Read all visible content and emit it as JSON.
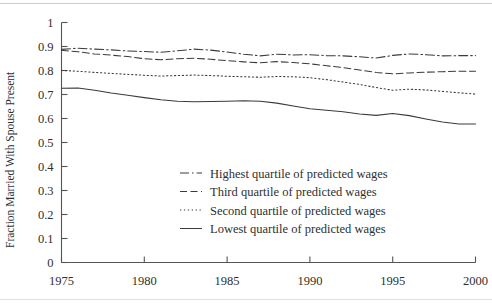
{
  "chart_data": {
    "type": "line",
    "title": "",
    "xlabel": "",
    "ylabel": "Fraction Married With Spouse Present",
    "xlim": [
      1975,
      2000
    ],
    "ylim": [
      0,
      1
    ],
    "grid": false,
    "legend_position": "center-right-inside",
    "x_ticks": [
      "1975",
      "1980",
      "1985",
      "1990",
      "1995",
      "2000"
    ],
    "x_tick_values": [
      1975,
      1980,
      1985,
      1990,
      1995,
      2000
    ],
    "y_ticks": [
      "0",
      "0.1",
      "0.2",
      "0.3",
      "0.4",
      "0.5",
      "0.6",
      "0.7",
      "0.8",
      "0.9",
      "1"
    ],
    "y_tick_values": [
      0,
      0.1,
      0.2,
      0.3,
      0.4,
      0.5,
      0.6,
      0.7,
      0.8,
      0.9,
      1
    ],
    "x": [
      1975,
      1976,
      1977,
      1978,
      1979,
      1980,
      1981,
      1982,
      1983,
      1984,
      1985,
      1986,
      1987,
      1988,
      1989,
      1990,
      1991,
      1992,
      1993,
      1994,
      1995,
      1996,
      1997,
      1998,
      1999,
      2000
    ],
    "series": [
      {
        "name": "Highest quartile of predicted wages",
        "style": "dash-dot",
        "color": "#3a3a3a",
        "values": [
          0.888,
          0.893,
          0.889,
          0.886,
          0.881,
          0.879,
          0.876,
          0.882,
          0.889,
          0.885,
          0.877,
          0.868,
          0.861,
          0.868,
          0.865,
          0.866,
          0.862,
          0.861,
          0.857,
          0.852,
          0.863,
          0.869,
          0.866,
          0.861,
          0.862,
          0.862
        ]
      },
      {
        "name": "Third quartile of predicted wages",
        "style": "dashed",
        "color": "#3a3a3a",
        "values": [
          0.884,
          0.878,
          0.869,
          0.864,
          0.858,
          0.849,
          0.845,
          0.849,
          0.851,
          0.847,
          0.841,
          0.836,
          0.832,
          0.837,
          0.833,
          0.828,
          0.82,
          0.812,
          0.802,
          0.792,
          0.786,
          0.79,
          0.793,
          0.795,
          0.797,
          0.797
        ]
      },
      {
        "name": "Second quartile of predicted wages",
        "style": "dotted",
        "color": "#3a3a3a",
        "values": [
          0.8,
          0.797,
          0.792,
          0.788,
          0.784,
          0.78,
          0.777,
          0.779,
          0.781,
          0.779,
          0.776,
          0.774,
          0.772,
          0.775,
          0.774,
          0.77,
          0.762,
          0.752,
          0.742,
          0.729,
          0.718,
          0.722,
          0.719,
          0.713,
          0.707,
          0.702
        ]
      },
      {
        "name": "Lowest quartile of predicted wages",
        "style": "solid",
        "color": "#3a3a3a",
        "values": [
          0.726,
          0.727,
          0.718,
          0.706,
          0.697,
          0.687,
          0.678,
          0.672,
          0.67,
          0.671,
          0.672,
          0.674,
          0.672,
          0.664,
          0.652,
          0.641,
          0.634,
          0.628,
          0.619,
          0.613,
          0.621,
          0.612,
          0.598,
          0.585,
          0.577,
          0.577
        ]
      }
    ],
    "legend_entries": [
      "Highest quartile of predicted wages",
      "Third quartile of predicted wages",
      "Second quartile of predicted wages",
      "Lowest quartile of predicted wages"
    ]
  }
}
